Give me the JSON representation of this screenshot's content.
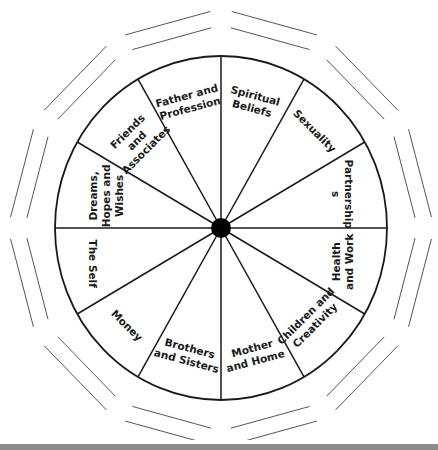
{
  "diagram": {
    "type": "astrological-houses-wheel",
    "center": {
      "x": 221,
      "y": 228
    },
    "radius_x": 166,
    "radius_y": 172,
    "hub_radius": 10,
    "colors": {
      "line": "#1a1a1a",
      "outer_lines": "#555555",
      "hub": "#000000",
      "background": "#ffffff",
      "bottom_bar": "#8c8c8c"
    },
    "sectors": [
      {
        "name": "spiritual-beliefs",
        "lines": [
          "Spiritual",
          "Beliefs"
        ],
        "start_deg": 0
      },
      {
        "name": "sexuality",
        "lines": [
          "Sexuality"
        ],
        "start_deg": 30
      },
      {
        "name": "partnerships",
        "lines": [
          "Partnership",
          "s"
        ],
        "start_deg": 60
      },
      {
        "name": "health-and-work",
        "lines": [
          "Health",
          "and Work"
        ],
        "start_deg": 90
      },
      {
        "name": "children-and-creativity",
        "lines": [
          "Children and",
          "Creativity"
        ],
        "start_deg": 120
      },
      {
        "name": "mother-and-home",
        "lines": [
          "Mother",
          "and Home"
        ],
        "start_deg": 150
      },
      {
        "name": "brothers-and-sisters",
        "lines": [
          "Brothers",
          "and Sisters"
        ],
        "start_deg": 180
      },
      {
        "name": "money",
        "lines": [
          "Money"
        ],
        "start_deg": 210
      },
      {
        "name": "the-self",
        "lines": [
          "The Self"
        ],
        "start_deg": 240
      },
      {
        "name": "dreams-hopes-and-wishes",
        "lines": [
          "Dreams,",
          "Hopes and",
          "Wishes"
        ],
        "start_deg": 270
      },
      {
        "name": "friends-and-associates",
        "lines": [
          "Friends",
          "and",
          "Associates"
        ],
        "start_deg": 300
      },
      {
        "name": "father-and-profession",
        "lines": [
          "Father and",
          "Profession"
        ],
        "start_deg": 330
      }
    ]
  }
}
